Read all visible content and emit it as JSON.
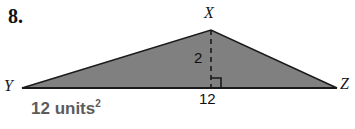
{
  "problem": {
    "number": "8."
  },
  "figure": {
    "type": "triangle",
    "vertices": {
      "apex_label": "X",
      "left_label": "Y",
      "right_label": "Z"
    },
    "measurements": {
      "height": "2",
      "base": "12"
    },
    "right_angle_marker": "right-angle-square",
    "height_line_style": "dashed",
    "fill_color": "#808080",
    "stroke_color": "#1a1a1a"
  },
  "answer": {
    "value": "12 units",
    "exponent": "2"
  }
}
